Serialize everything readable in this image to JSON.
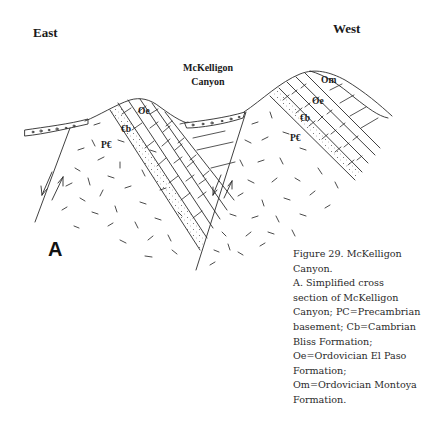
{
  "figure": {
    "orientation": {
      "left_label": "East",
      "right_label": "West"
    },
    "canyon_label": {
      "line1": "McKelligon",
      "line2": "Canyon"
    },
    "panel_label": "A",
    "units": {
      "left_block": {
        "precambrian": "P€",
        "cambrian_bliss": "€b",
        "el_paso": "Oe"
      },
      "right_block": {
        "precambrian": "P€",
        "cambrian_bliss": "€b",
        "el_paso": "Oe",
        "montoya": "Om"
      }
    },
    "caption": {
      "lines": [
        "Figure 29. McKelligon",
        "Canyon.",
        "A. Simplified cross",
        "section of McKelligon",
        "Canyon; PC=Precambrian",
        "basement; Cb=Cambrian",
        "Bliss Formation;",
        "Oe=Ordovician El Paso",
        "Formation;",
        "Om=Ordovician Montoya",
        "Formation."
      ]
    },
    "colors": {
      "line": "#2b2b2b",
      "background": "#ffffff",
      "text": "#1a1a1a"
    }
  }
}
